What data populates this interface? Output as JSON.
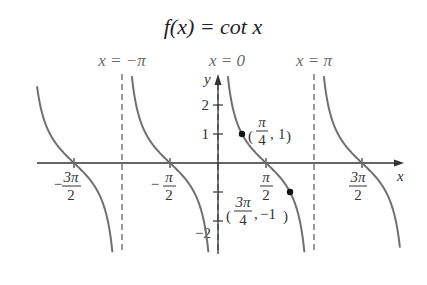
{
  "title": "f(x) = cot x",
  "asymptote_labels": [
    "x = −π",
    "x = 0",
    "x = π"
  ],
  "axis_labels": {
    "x": "x",
    "y": "y"
  },
  "x_ticks": [
    {
      "num": "3π",
      "den": "2",
      "sign": "−",
      "value": -4.712
    },
    {
      "num": "π",
      "den": "2",
      "sign": "−",
      "value": -1.571
    },
    {
      "num": "π",
      "den": "2",
      "sign": "",
      "value": 1.571
    },
    {
      "num": "3π",
      "den": "2",
      "sign": "",
      "value": 4.712
    }
  ],
  "y_ticks": [
    {
      "label": "2",
      "value": 2
    },
    {
      "label": "1",
      "value": 1
    },
    {
      "label": "",
      "value": -1
    },
    {
      "label": "−2",
      "value": -2
    }
  ],
  "points": [
    {
      "label_num": "π",
      "label_den": "4",
      "label_y": "1",
      "x": 0.785,
      "y": 1
    },
    {
      "label_num": "3π",
      "label_den": "4",
      "label_y": "−1",
      "x": 2.356,
      "y": -1
    }
  ],
  "colors": {
    "curve": "#707070",
    "axis": "#333333",
    "asymptote": "#555555",
    "text": "#333333"
  },
  "chart_data": {
    "type": "line",
    "title": "f(x) = cot x",
    "xlabel": "x",
    "ylabel": "y",
    "function": "cot x",
    "x_tick_labels": [
      "−3π/2",
      "−π/2",
      "π/2",
      "3π/2"
    ],
    "y_tick_labels": [
      "2",
      "1",
      "−2"
    ],
    "vertical_asymptotes": [
      "x = −π",
      "x = 0",
      "x = π"
    ],
    "labeled_points": [
      {
        "label": "(π/4, 1)",
        "x": 0.785,
        "y": 1
      },
      {
        "label": "(3π/4, −1)",
        "x": 2.356,
        "y": -1
      }
    ],
    "xlim": [
      -5.9,
      6.1
    ],
    "ylim": [
      -3.1,
      3.1
    ],
    "grid": false
  }
}
